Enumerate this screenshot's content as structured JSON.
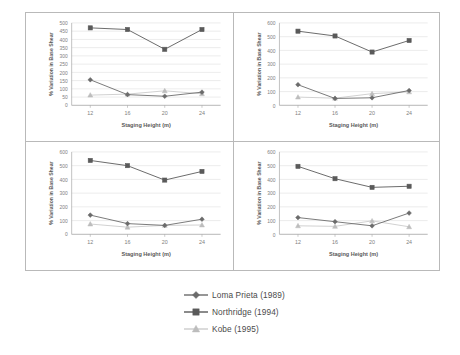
{
  "figure": {
    "background_color": "#ffffff",
    "panel_border_color": "#b9b9b9"
  },
  "series_styles": {
    "loma_prieta": {
      "color": "#6b6b6b",
      "marker": "diamond",
      "label_key": "Loma Prieta (1989)"
    },
    "northridge": {
      "color": "#5a5a5a",
      "marker": "square",
      "label_key": "Northridge (1994)"
    },
    "kobe": {
      "color": "#bdbdbd",
      "marker": "triangle",
      "label_key": "Kobe (1995)"
    }
  },
  "legend": {
    "position": "bottom-center",
    "items": [
      {
        "label": "Loma Prieta (1989)",
        "marker": "diamond",
        "color": "#6b6b6b"
      },
      {
        "label": "Northridge (1994)",
        "marker": "square",
        "color": "#5a5a5a"
      },
      {
        "label": "Kobe (1995)",
        "marker": "triangle",
        "color": "#bdbdbd"
      }
    ]
  },
  "chart_data": [
    {
      "id": "top-left",
      "type": "line",
      "title": "",
      "xlabel": "Staging Height (m)",
      "ylabel": "% Variation in Base Shear",
      "categories": [
        12,
        16,
        20,
        24
      ],
      "xtick_labels": [
        "12",
        "16",
        "20",
        "24"
      ],
      "ytick_labels": [
        "0",
        "50",
        "100",
        "150",
        "200",
        "250",
        "300",
        "350",
        "400",
        "450",
        "500"
      ],
      "ylim": [
        0,
        500
      ],
      "ytick_step": 50,
      "grid": true,
      "series": [
        {
          "name": "Loma Prieta (1989)",
          "values": [
            155,
            65,
            55,
            80
          ]
        },
        {
          "name": "Northridge (1994)",
          "values": [
            470,
            460,
            340,
            460
          ]
        },
        {
          "name": "Kobe (1995)",
          "values": [
            62,
            68,
            88,
            70
          ]
        }
      ]
    },
    {
      "id": "top-right",
      "type": "line",
      "title": "",
      "xlabel": "Staging Height (m)",
      "ylabel": "% Variation in Base Shear",
      "categories": [
        12,
        16,
        20,
        24
      ],
      "xtick_labels": [
        "12",
        "16",
        "20",
        "24"
      ],
      "ytick_labels": [
        "0",
        "100",
        "200",
        "300",
        "400",
        "500",
        "600"
      ],
      "ylim": [
        0,
        600
      ],
      "ytick_step": 100,
      "grid": true,
      "series": [
        {
          "name": "Loma Prieta (1989)",
          "values": [
            150,
            50,
            55,
            108
          ]
        },
        {
          "name": "Northridge (1994)",
          "values": [
            540,
            505,
            388,
            472
          ]
        },
        {
          "name": "Kobe (1995)",
          "values": [
            60,
            52,
            85,
            98
          ]
        }
      ]
    },
    {
      "id": "bottom-left",
      "type": "line",
      "title": "",
      "xlabel": "Staging Height (m)",
      "ylabel": "% Variation in Base Shear",
      "categories": [
        12,
        16,
        20,
        24
      ],
      "xtick_labels": [
        "12",
        "16",
        "20",
        "24"
      ],
      "ytick_labels": [
        "0",
        "100",
        "200",
        "300",
        "400",
        "500",
        "600"
      ],
      "ylim": [
        0,
        600
      ],
      "ytick_step": 100,
      "grid": true,
      "series": [
        {
          "name": "Loma Prieta (1989)",
          "values": [
            140,
            78,
            65,
            110
          ]
        },
        {
          "name": "Northridge (1994)",
          "values": [
            538,
            500,
            395,
            458
          ]
        },
        {
          "name": "Kobe (1995)",
          "values": [
            75,
            52,
            65,
            68
          ]
        }
      ]
    },
    {
      "id": "bottom-right",
      "type": "line",
      "title": "",
      "xlabel": "Staging Height (m)",
      "ylabel": "% Variation in Base Shear",
      "categories": [
        12,
        16,
        20,
        24
      ],
      "xtick_labels": [
        "12",
        "16",
        "20",
        "24"
      ],
      "ytick_labels": [
        "0",
        "100",
        "200",
        "300",
        "400",
        "500",
        "600"
      ],
      "ylim": [
        0,
        600
      ],
      "ytick_step": 100,
      "grid": true,
      "series": [
        {
          "name": "Loma Prieta (1989)",
          "values": [
            122,
            92,
            62,
            155
          ]
        },
        {
          "name": "Northridge (1994)",
          "values": [
            495,
            405,
            342,
            350
          ]
        },
        {
          "name": "Kobe (1995)",
          "values": [
            62,
            58,
            98,
            55
          ]
        }
      ]
    }
  ]
}
